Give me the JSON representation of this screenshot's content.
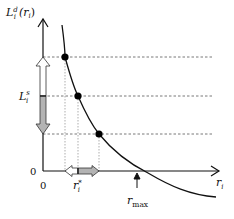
{
  "diagram": {
    "y_axis_label": {
      "base": "L",
      "sup": "d",
      "sub": "i",
      "arg": "(r",
      "arg_sub": "i",
      "arg_close": ")"
    },
    "x_axis_label": {
      "base": "r",
      "sub": "i"
    },
    "y_tick_label": {
      "base": "L",
      "sup": "s",
      "sub": "i"
    },
    "x_tick_label": {
      "base": "r",
      "sup": "*",
      "sub": "i"
    },
    "origin_y_label": "0",
    "origin_x_label": "0",
    "rmax_label": {
      "base": "r",
      "sub": "max"
    },
    "colors": {
      "axis": "#111111",
      "curve": "#111111",
      "dashed": "#555555",
      "arrow_fill_gray": "#b3b3b3",
      "arrow_fill_white": "#ffffff",
      "dot": "#000000"
    },
    "points": [
      {
        "name": "upper-point",
        "x": 65,
        "y": 57
      },
      {
        "name": "middle-point",
        "x": 78,
        "y": 96
      },
      {
        "name": "lower-point",
        "x": 99,
        "y": 134
      }
    ]
  }
}
